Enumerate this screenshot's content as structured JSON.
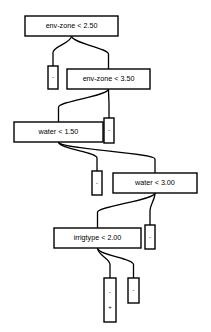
{
  "diagram": {
    "type": "decision-tree",
    "title": "",
    "background_color": "#ffffff",
    "line_color": "#000000",
    "node_fill": "#ffffff",
    "internal_nodes": [
      {
        "id": "n0",
        "label": "env-zone < 2.50",
        "x": 25,
        "y": 16,
        "w": 93,
        "h": 20
      },
      {
        "id": "n1",
        "label": "env-zone < 3.50",
        "x": 67,
        "y": 69,
        "w": 83,
        "h": 20
      },
      {
        "id": "n2",
        "label": "water < 1.50",
        "x": 14,
        "y": 122,
        "w": 89,
        "h": 20
      },
      {
        "id": "n3",
        "label": "water < 3.00",
        "x": 113,
        "y": 173,
        "w": 84,
        "h": 20
      },
      {
        "id": "n4",
        "label": "irrigtype < 2.00",
        "x": 54,
        "y": 228,
        "w": 87,
        "h": 20
      }
    ],
    "leaf_nodes": [
      {
        "id": "l0",
        "x": 48,
        "y": 66,
        "w": 10,
        "h": 23,
        "marks": [
          "-"
        ]
      },
      {
        "id": "l1",
        "x": 104,
        "y": 118,
        "w": 10,
        "h": 25,
        "marks": [
          "-"
        ]
      },
      {
        "id": "l2",
        "x": 92,
        "y": 171,
        "w": 10,
        "h": 24,
        "marks": [
          "-"
        ]
      },
      {
        "id": "l3",
        "x": 145,
        "y": 225,
        "w": 10,
        "h": 24,
        "marks": [
          "-"
        ]
      },
      {
        "id": "l4",
        "x": 104,
        "y": 278,
        "w": 12,
        "h": 44,
        "marks": [
          "-",
          "+"
        ]
      },
      {
        "id": "l5",
        "x": 128,
        "y": 278,
        "w": 11,
        "h": 25,
        "marks": [
          "-"
        ]
      }
    ],
    "edges": [
      {
        "from": "n0",
        "to": "l0",
        "branch": "left"
      },
      {
        "from": "n0",
        "to": "n1",
        "branch": "right"
      },
      {
        "from": "n1",
        "to": "n2",
        "branch": "left"
      },
      {
        "from": "n1",
        "to": "l1",
        "branch": "right"
      },
      {
        "from": "n2",
        "to": "l2",
        "branch": "left"
      },
      {
        "from": "n2",
        "to": "n3",
        "branch": "right"
      },
      {
        "from": "n3",
        "to": "n4",
        "branch": "left"
      },
      {
        "from": "n3",
        "to": "l3",
        "branch": "right"
      },
      {
        "from": "n4",
        "to": "l4",
        "branch": "left"
      },
      {
        "from": "n4",
        "to": "l5",
        "branch": "right"
      }
    ]
  }
}
